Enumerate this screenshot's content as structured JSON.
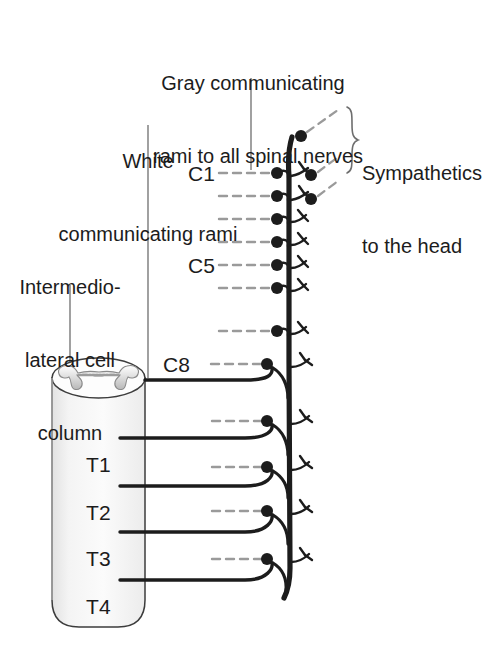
{
  "figure": {
    "background_color": "#ffffff",
    "ink_color": "#1c1c1c",
    "gray_rami_color": "#9a9a9a",
    "cord_fill_color": "#f2f2f2",
    "width": 487,
    "height": 653
  },
  "annotations": {
    "gray_rami": {
      "line1": "Gray communicating",
      "line2": "rami to all spinal nerves"
    },
    "white_rami": {
      "line1": "White",
      "line2": "communicating rami"
    },
    "ilcc": {
      "line1": "Intermedio-",
      "line2": "lateral cell",
      "line3": "column"
    },
    "sympathetics_head": {
      "line1": "Sympathetics",
      "line2": "to the head"
    }
  },
  "levels": {
    "cervical": [
      {
        "label": "C1",
        "shown": true
      },
      {
        "label": "C2",
        "shown": false
      },
      {
        "label": "C3",
        "shown": false
      },
      {
        "label": "C4",
        "shown": false
      },
      {
        "label": "C5",
        "shown": true
      },
      {
        "label": "C6",
        "shown": false
      },
      {
        "label": "C7",
        "shown": false
      },
      {
        "label": "C8",
        "shown": true
      }
    ],
    "thoracic": [
      {
        "label": "T1",
        "shown": true
      },
      {
        "label": "T2",
        "shown": true
      },
      {
        "label": "T3",
        "shown": true
      },
      {
        "label": "T4",
        "shown": true
      }
    ]
  },
  "structures": {
    "spinal_cord": "spinal-cord-cylinder",
    "gray_matter": "butterfly-gray-matter",
    "sympathetic_trunk": "sympathetic-chain-trunk",
    "ganglion": "sympathetic-ganglion",
    "head_rami_count": 3,
    "brace": "curly-brace"
  }
}
